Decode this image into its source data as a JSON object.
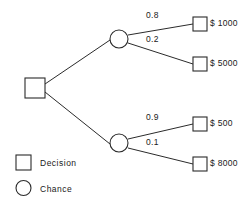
{
  "diagram": {
    "type": "decision-tree",
    "root": {
      "node_type": "decision",
      "shape": "square"
    },
    "branches": [
      {
        "id": "upper",
        "node_type": "chance",
        "shape": "circle",
        "outcomes": [
          {
            "probability": "0.8",
            "payoff": "$ 1000",
            "node_type": "decision"
          },
          {
            "probability": "0.2",
            "payoff": "$ 5000",
            "node_type": "decision"
          }
        ]
      },
      {
        "id": "lower",
        "node_type": "chance",
        "shape": "circle",
        "outcomes": [
          {
            "probability": "0.9",
            "payoff": "$ 500",
            "node_type": "decision"
          },
          {
            "probability": "0.1",
            "payoff": "$ 8000",
            "node_type": "decision"
          }
        ]
      }
    ]
  },
  "legend": {
    "items": [
      {
        "symbol": "square",
        "label": "Decision"
      },
      {
        "symbol": "circle",
        "label": "Chance"
      }
    ]
  },
  "colors": {
    "stroke": "#2b2b2b",
    "text": "#1a1a1a",
    "background": "#ffffff",
    "node_fill": "#ffffff"
  }
}
